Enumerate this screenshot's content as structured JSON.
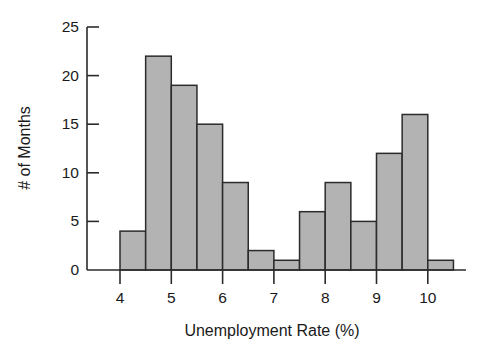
{
  "chart_data": {
    "type": "bar",
    "title": "",
    "subtitle": "",
    "xlabel": "Unemployment Rate (%)",
    "ylabel": "# of Months",
    "xlim": [
      3.7,
      10.8
    ],
    "ylim": [
      0,
      25.6
    ],
    "grid": false,
    "legend": null,
    "bin_width": 0.5,
    "xticks": [
      4,
      5,
      6,
      7,
      8,
      9,
      10
    ],
    "xtick_labels": [
      "4",
      "5",
      "6",
      "7",
      "8",
      "9",
      "10"
    ],
    "yticks": [
      0,
      5,
      10,
      15,
      20,
      25
    ],
    "ytick_labels": [
      "0",
      "5",
      "10",
      "15",
      "20",
      "25"
    ],
    "bins": [
      {
        "x0": 4.0,
        "x1": 4.5,
        "value": 4
      },
      {
        "x0": 4.5,
        "x1": 5.0,
        "value": 22
      },
      {
        "x0": 5.0,
        "x1": 5.5,
        "value": 19
      },
      {
        "x0": 5.5,
        "x1": 6.0,
        "value": 15
      },
      {
        "x0": 6.0,
        "x1": 6.5,
        "value": 9
      },
      {
        "x0": 6.5,
        "x1": 7.0,
        "value": 2
      },
      {
        "x0": 7.0,
        "x1": 7.5,
        "value": 1
      },
      {
        "x0": 7.5,
        "x1": 8.0,
        "value": 6
      },
      {
        "x0": 8.0,
        "x1": 8.5,
        "value": 9
      },
      {
        "x0": 8.5,
        "x1": 9.0,
        "value": 5
      },
      {
        "x0": 9.0,
        "x1": 9.5,
        "value": 12
      },
      {
        "x0": 9.5,
        "x1": 10.0,
        "value": 16
      },
      {
        "x0": 10.0,
        "x1": 10.5,
        "value": 1
      }
    ],
    "categories": [
      "4.0-4.5",
      "4.5-5.0",
      "5.0-5.5",
      "5.5-6.0",
      "6.0-6.5",
      "6.5-7.0",
      "7.0-7.5",
      "7.5-8.0",
      "8.0-8.5",
      "8.5-9.0",
      "9.0-9.5",
      "9.5-10.0",
      "10.0-10.5"
    ],
    "values": [
      4,
      22,
      19,
      15,
      9,
      2,
      1,
      6,
      9,
      5,
      12,
      16,
      1
    ],
    "colors": {
      "bar_fill": "#b3b3b3",
      "bar_stroke": "#2b2b2b",
      "axis": "#2b2b2b",
      "text": "#1a1a1a",
      "background": "#ffffff"
    }
  },
  "geometry": {
    "plot_left": 87,
    "plot_baseline_y": 270,
    "plot_top_y": 27,
    "x_at_4": 120,
    "px_per_x_unit": 51.3,
    "px_per_y_unit": 9.72,
    "x_axis_right": 466,
    "y_label_x": 30,
    "y_label_y": 148,
    "x_label_x": 272,
    "x_label_y": 334
  }
}
